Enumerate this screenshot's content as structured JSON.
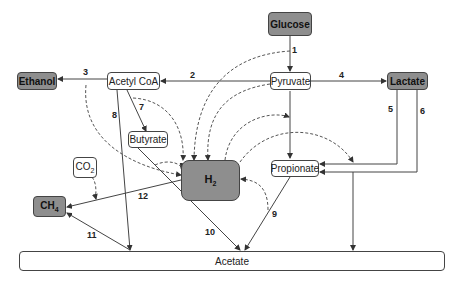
{
  "diagram": {
    "nodes": {
      "glucose": "Glucose",
      "pyruvate": "Pyruvate",
      "lactate": "Lactate",
      "acetyl_coa": "Acetyl CoA",
      "ethanol": "Ethanol",
      "butyrate": "Butyrate",
      "co2_base": "CO",
      "co2_sub": "2",
      "ch4_base": "CH",
      "ch4_sub": "4",
      "h2_base": "H",
      "h2_sub": "2",
      "propionate": "Propionate",
      "acetate": "Acetate"
    },
    "edge_labels": {
      "e1": "1",
      "e2": "2",
      "e3": "3",
      "e4": "4",
      "e5": "5",
      "e6": "6",
      "e7": "7",
      "e8": "8",
      "e9": "9",
      "e10": "10",
      "e11": "11",
      "e12": "12"
    },
    "edges": [
      {
        "id": "1",
        "from": "Glucose",
        "to": "Pyruvate"
      },
      {
        "id": "2",
        "from": "Pyruvate",
        "to": "Acetyl CoA"
      },
      {
        "id": "3",
        "from": "Acetyl CoA",
        "to": "Ethanol"
      },
      {
        "id": "4",
        "from": "Pyruvate",
        "to": "Lactate"
      },
      {
        "id": "5",
        "from": "Lactate",
        "to": "Propionate"
      },
      {
        "id": "6",
        "from": "Lactate",
        "to": "Propionate / Acetate"
      },
      {
        "id": "7",
        "from": "Acetyl CoA",
        "to": "Butyrate"
      },
      {
        "id": "8",
        "from": "Acetyl CoA",
        "to": "Acetate"
      },
      {
        "id": "9",
        "from": "Propionate",
        "to": "Acetate"
      },
      {
        "id": "10",
        "from": "Butyrate",
        "to": "Acetate"
      },
      {
        "id": "11",
        "from": "Acetate",
        "to": "CH4"
      },
      {
        "id": "12",
        "from": "H2",
        "to": "CH4"
      }
    ],
    "colors": {
      "dark_node": "#8e8e8e",
      "line": "#444444"
    }
  }
}
